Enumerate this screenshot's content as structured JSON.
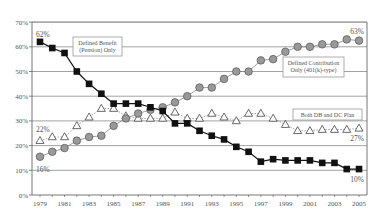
{
  "chart_data": {
    "type": "line",
    "title": "",
    "xlabel": "",
    "ylabel": "",
    "ylim": [
      0,
      70
    ],
    "yticks": [
      "0%",
      "10%",
      "20%",
      "30%",
      "40%",
      "50%",
      "60%",
      "70%"
    ],
    "xtick_labels": [
      "1979",
      "1981",
      "1983",
      "1985",
      "1987",
      "1989",
      "1991",
      "1993",
      "1995",
      "1997",
      "1999",
      "2001",
      "2003",
      "2005"
    ],
    "grid": "horizontal",
    "x": [
      1979,
      1980,
      1981,
      1982,
      1983,
      1984,
      1985,
      1986,
      1987,
      1988,
      1989,
      1990,
      1991,
      1992,
      1993,
      1994,
      1995,
      1996,
      1997,
      1998,
      1999,
      2000,
      2001,
      2002,
      2003,
      2004,
      2005
    ],
    "series": [
      {
        "name": "Defined Benefit (Pension) Only",
        "legend_lines": [
          "Defined Benefit",
          "(Pension) Only"
        ],
        "marker": "square",
        "color": "#111111",
        "line_style": "solid",
        "values": [
          62,
          59.5,
          57.5,
          50,
          45,
          41,
          37,
          37,
          37,
          35.5,
          34,
          29,
          29,
          26,
          24,
          22.5,
          19.5,
          17.5,
          13.5,
          14.5,
          14,
          14,
          14,
          13,
          13,
          10.5,
          10.5
        ],
        "start_label": "62%",
        "end_label": "10%"
      },
      {
        "name": "Defined Contribution Only (401(k)-type)",
        "legend_lines": [
          "Defined Contribution",
          "Only (401(k)-type)"
        ],
        "marker": "circle",
        "color": "#999999",
        "line_style": "solid",
        "values": [
          15.5,
          17.5,
          19,
          22,
          23.5,
          24,
          28,
          31,
          33,
          34.5,
          35.5,
          37.5,
          40,
          43.5,
          43.5,
          47,
          50,
          50,
          54.5,
          55,
          58,
          60,
          60,
          61,
          61,
          63,
          62.5
        ],
        "start_label": "16%",
        "end_label": "63%"
      },
      {
        "name": "Both DB and DC Plan",
        "legend_lines": [
          "Both DB and DC Plan"
        ],
        "marker": "triangle-open",
        "color": "#777777",
        "line_style": "dotted",
        "values": [
          22,
          23.5,
          23.5,
          28,
          31.5,
          35,
          35,
          32,
          31,
          31,
          31,
          33.5,
          31,
          31,
          33,
          31.5,
          30,
          33,
          33,
          31,
          28.5,
          26,
          26,
          26.5,
          26.5,
          26.5,
          27
        ],
        "start_label": "22%",
        "end_label": "27%"
      }
    ]
  }
}
